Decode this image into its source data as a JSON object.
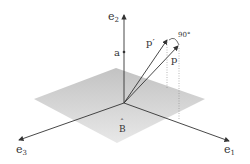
{
  "figure": {
    "labels": {
      "e1": "e",
      "e1_sub": "1",
      "e2": "e",
      "e2_sub": "2",
      "e3": "e",
      "e3_sub": "3",
      "a": "a",
      "p": "p",
      "p_prime": "p′",
      "angle": "90°",
      "B_hat": "B",
      "B_hat_accent": "ˆ"
    },
    "colors": {
      "plane": "#c8c8c8",
      "axis": "#333333",
      "dotted": "#888888",
      "background": "#ffffff"
    }
  }
}
